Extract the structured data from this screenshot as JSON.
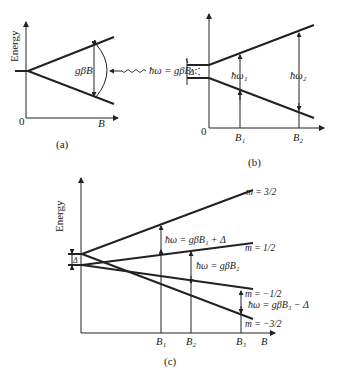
{
  "panels": {
    "a": {
      "caption": "(a)",
      "ylabel": "Energy",
      "xlabel": "B",
      "origin": "0",
      "gap_label": "gβB",
      "photon_label": "ħω = gβB"
    },
    "b": {
      "caption": "(b)",
      "origin": "0",
      "zero_field_label": "Δ",
      "transition1_label": "ħω₁",
      "transition2_label": "ħω₂",
      "tick1": "B₁",
      "tick2": "B₂"
    },
    "c": {
      "caption": "(c)",
      "ylabel": "Energy",
      "xlabel": "B",
      "zero_field_label": "Δ",
      "level_labels": [
        "m = 3/2",
        "m = 1/2",
        "m = −1/2",
        "m = −3/2"
      ],
      "transition1_label": "ħω = gβB₁ + Δ",
      "transition2_label": "ħω = gβB₂",
      "transition3_label": "ħω = gβB₃ − Δ",
      "tick1": "B₁",
      "tick2": "B₂",
      "tick3": "B₃"
    }
  }
}
